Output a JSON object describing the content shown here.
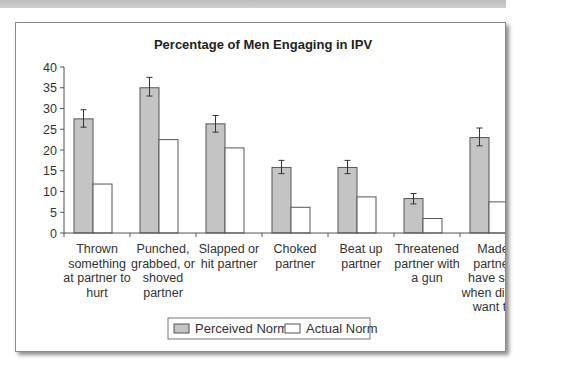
{
  "chart_data": {
    "type": "bar",
    "title": "Percentage of Men Engaging in IPV",
    "xlabel": "",
    "ylabel": "",
    "ylim": [
      0,
      40
    ],
    "yticks": [
      0,
      5,
      10,
      15,
      20,
      25,
      30,
      35,
      40
    ],
    "grid": false,
    "legend_position": "bottom",
    "categories": [
      "Thrown something at partner to hurt",
      "Punched, grabbed, or shoved partner",
      "Slapped or hit partner",
      "Choked partner",
      "Beat up partner",
      "Threatened partner with a gun",
      "Made partner have sex when didn't want to"
    ],
    "category_label_lines": [
      [
        "Thrown",
        "something",
        "at partner to",
        "hurt"
      ],
      [
        "Punched,",
        "grabbed, or",
        "shoved",
        "partner"
      ],
      [
        "Slapped or",
        "hit partner"
      ],
      [
        "Choked",
        "partner"
      ],
      [
        "Beat up",
        "partner"
      ],
      [
        "Threatened",
        "partner with",
        "a gun"
      ],
      [
        "Made",
        "partner",
        "have sex",
        "when didn't",
        "want to"
      ]
    ],
    "series": [
      {
        "name": "Perceived Norm",
        "color": "#c4c4c4",
        "values": [
          27.5,
          35.0,
          26.3,
          15.8,
          15.8,
          8.3,
          23.0
        ],
        "error_low": [
          25.5,
          33.0,
          24.3,
          14.3,
          14.3,
          7.0,
          21.0
        ],
        "error_high": [
          29.7,
          37.5,
          28.3,
          17.5,
          17.5,
          9.5,
          25.3
        ]
      },
      {
        "name": "Actual Norm",
        "color": "#ffffff",
        "values": [
          11.8,
          22.5,
          20.5,
          6.2,
          8.7,
          3.5,
          7.5
        ]
      }
    ]
  }
}
